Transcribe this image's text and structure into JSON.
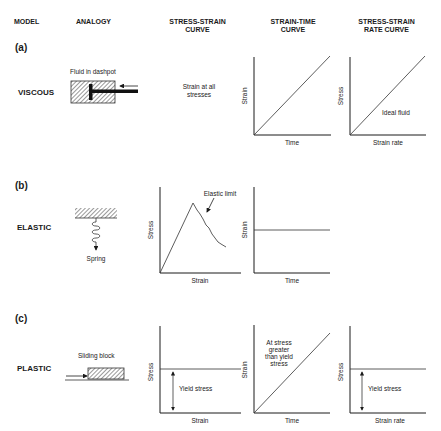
{
  "headers": {
    "model": "MODEL",
    "analogy": "ANALOGY",
    "stress_strain_1": "STRESS-STRAIN",
    "stress_strain_2": "CURVE",
    "strain_time_1": "STRAIN-TIME",
    "strain_time_2": "CURVE",
    "rate_1": "STRESS-STRAIN",
    "rate_2": "RATE CURVE"
  },
  "rows": [
    {
      "panel": "(a)",
      "model": "VISCOUS",
      "analogy_label": "Fluid in dashpot",
      "stress_strain_note_1": "Strain at all",
      "stress_strain_note_2": "stresses",
      "strain_time": {
        "ylabel": "Strain",
        "xlabel": "Time"
      },
      "rate": {
        "ylabel": "Stress",
        "xlabel": "Strain rate",
        "note": "Ideal fluid"
      }
    },
    {
      "panel": "(b)",
      "model": "ELASTIC",
      "analogy_label": "Spring",
      "stress_strain": {
        "ylabel": "Stress",
        "xlabel": "Strain",
        "note": "Elastic limit"
      },
      "strain_time": {
        "ylabel": "Strain",
        "xlabel": "Time"
      }
    },
    {
      "panel": "(c)",
      "model": "PLASTIC",
      "analogy_label": "Sliding block",
      "stress_strain": {
        "ylabel": "Stress",
        "xlabel": "Strain",
        "note": "Yield stress"
      },
      "strain_time": {
        "ylabel": "Strain",
        "xlabel": "Time",
        "note_1": "At stress",
        "note_2": "greater",
        "note_3": "than yield",
        "note_4": "stress"
      },
      "rate": {
        "ylabel": "Stress",
        "xlabel": "Strain rate",
        "note": "Yield stress"
      }
    }
  ]
}
